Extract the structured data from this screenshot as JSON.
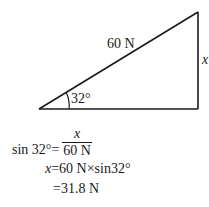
{
  "diagram": {
    "type": "right-triangle",
    "vertices": {
      "angle_vertex": [
        39,
        109
      ],
      "top_right": [
        198,
        12
      ],
      "bottom_right": [
        198,
        109
      ]
    },
    "labels": {
      "hypotenuse": "60 N",
      "opposite": "x",
      "angle": "32°"
    },
    "stroke_color": "#1a1a1a"
  },
  "equations": {
    "line1_lhs": "sin 32°=",
    "line1_num": "x",
    "line1_den": "60 N",
    "line2_var": "x",
    "line2_rhs": "=60 N×sin32°",
    "line3": "=31.8 N"
  }
}
